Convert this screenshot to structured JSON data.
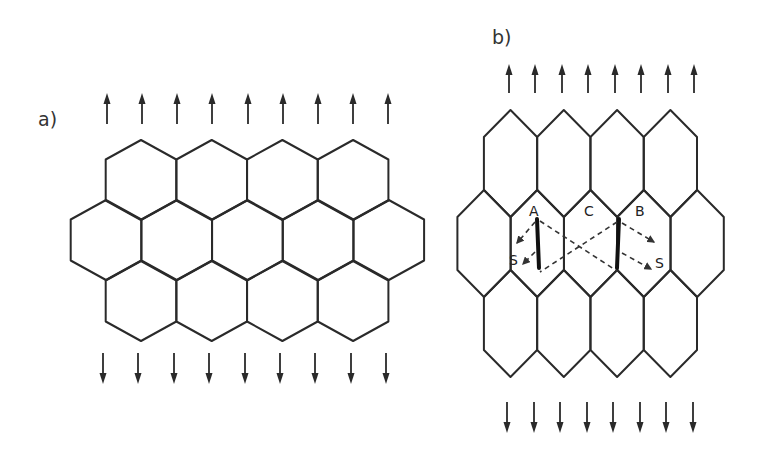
{
  "figure": {
    "line_color": "#2a2a2a",
    "background": "#ffffff"
  },
  "panels": [
    {
      "id": "a",
      "label": "a)",
      "grain_shape": "regular-hexagon",
      "rows": [
        4,
        5,
        4
      ],
      "arrows_top": {
        "count": 9,
        "direction": "up"
      },
      "arrows_bottom": {
        "count": 9,
        "direction": "down"
      }
    },
    {
      "id": "b",
      "label": "b)",
      "grain_shape": "elongated-hexagon",
      "rows": [
        4,
        5,
        4
      ],
      "arrows_top": {
        "count": 8,
        "direction": "up"
      },
      "arrows_bottom": {
        "count": 8,
        "direction": "down"
      },
      "grain_labels": {
        "A": "A",
        "C": "C",
        "B": "B",
        "S_left": "S",
        "S_right": "S"
      },
      "annotations": {
        "cracked_boundaries": [
          "A|C",
          "C|B"
        ],
        "dashed_cross_in": "C",
        "dashed_arrows_to_S": [
          "A",
          "B"
        ]
      }
    }
  ]
}
